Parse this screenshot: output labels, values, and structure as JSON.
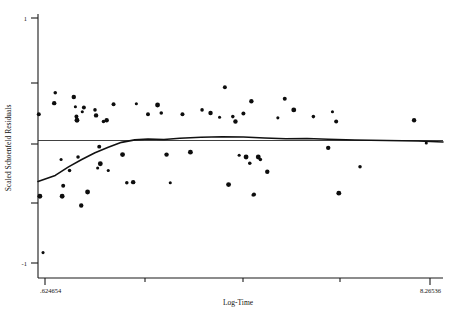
{
  "chart_data": {
    "type": "scatter",
    "title": "",
    "xlabel": "Log-Time",
    "ylabel": "Scaled Schoenfeld Residuals",
    "xlim": [
      0.624654,
      8.26536
    ],
    "ylim": [
      -1,
      1
    ],
    "grid": false,
    "legend": null,
    "x_tick_labels": [
      ".624654",
      "8.26536"
    ],
    "y_tick_labels": [
      "1",
      "-1"
    ],
    "y_tick_values": [
      1,
      0.5,
      0,
      -0.5,
      -1
    ],
    "reference_line": {
      "type": "horizontal",
      "y": 0
    },
    "points": [
      {
        "x": 0.72,
        "y": -0.915
      },
      {
        "x": 0.64,
        "y": 0.215
      },
      {
        "x": 0.66,
        "y": -0.455
      },
      {
        "x": 0.95,
        "y": 0.39
      },
      {
        "x": 0.93,
        "y": 0.305
      },
      {
        "x": 1.06,
        "y": -0.155
      },
      {
        "x": 1.1,
        "y": -0.37
      },
      {
        "x": 1.08,
        "y": -0.455
      },
      {
        "x": 1.22,
        "y": -0.245
      },
      {
        "x": 1.3,
        "y": 0.355
      },
      {
        "x": 1.33,
        "y": 0.275
      },
      {
        "x": 1.35,
        "y": 0.195
      },
      {
        "x": 1.36,
        "y": 0.165
      },
      {
        "x": 1.38,
        "y": -0.135
      },
      {
        "x": 1.44,
        "y": -0.53
      },
      {
        "x": 1.46,
        "y": 0.235
      },
      {
        "x": 1.49,
        "y": 0.27
      },
      {
        "x": 1.56,
        "y": -0.42
      },
      {
        "x": 1.7,
        "y": 0.25
      },
      {
        "x": 1.72,
        "y": 0.205
      },
      {
        "x": 1.75,
        "y": -0.225
      },
      {
        "x": 1.78,
        "y": -0.05
      },
      {
        "x": 1.8,
        "y": -0.19
      },
      {
        "x": 1.86,
        "y": 0.155
      },
      {
        "x": 1.92,
        "y": 0.165
      },
      {
        "x": 1.95,
        "y": -0.245
      },
      {
        "x": 2.05,
        "y": 0.295
      },
      {
        "x": 2.22,
        "y": -0.115
      },
      {
        "x": 2.3,
        "y": -0.345
      },
      {
        "x": 2.42,
        "y": -0.34
      },
      {
        "x": 2.48,
        "y": 0.3
      },
      {
        "x": 2.7,
        "y": 0.215
      },
      {
        "x": 2.88,
        "y": 0.29
      },
      {
        "x": 2.95,
        "y": 0.225
      },
      {
        "x": 3.05,
        "y": -0.115
      },
      {
        "x": 3.12,
        "y": -0.345
      },
      {
        "x": 3.35,
        "y": 0.215
      },
      {
        "x": 3.5,
        "y": -0.095
      },
      {
        "x": 3.72,
        "y": 0.25
      },
      {
        "x": 3.88,
        "y": 0.225
      },
      {
        "x": 4.05,
        "y": 0.19
      },
      {
        "x": 4.15,
        "y": 0.435
      },
      {
        "x": 4.22,
        "y": -0.36
      },
      {
        "x": 4.3,
        "y": 0.195
      },
      {
        "x": 4.35,
        "y": 0.155
      },
      {
        "x": 4.42,
        "y": -0.12
      },
      {
        "x": 4.5,
        "y": 0.22
      },
      {
        "x": 4.55,
        "y": -0.135
      },
      {
        "x": 4.62,
        "y": -0.185
      },
      {
        "x": 4.65,
        "y": 0.32
      },
      {
        "x": 4.68,
        "y": -0.445
      },
      {
        "x": 4.7,
        "y": -0.44
      },
      {
        "x": 4.78,
        "y": -0.135
      },
      {
        "x": 4.82,
        "y": -0.155
      },
      {
        "x": 4.95,
        "y": -0.255
      },
      {
        "x": 5.15,
        "y": 0.185
      },
      {
        "x": 5.28,
        "y": 0.34
      },
      {
        "x": 5.45,
        "y": 0.25
      },
      {
        "x": 5.82,
        "y": 0.195
      },
      {
        "x": 6.1,
        "y": -0.06
      },
      {
        "x": 6.18,
        "y": 0.235
      },
      {
        "x": 6.25,
        "y": 0.155
      },
      {
        "x": 6.3,
        "y": -0.43
      },
      {
        "x": 6.7,
        "y": -0.215
      },
      {
        "x": 7.72,
        "y": 0.165
      },
      {
        "x": 7.95,
        "y": -0.02
      }
    ],
    "smooth_curve": [
      {
        "x": 0.624654,
        "y": -0.335
      },
      {
        "x": 0.95,
        "y": -0.285
      },
      {
        "x": 1.2,
        "y": -0.215
      },
      {
        "x": 1.45,
        "y": -0.155
      },
      {
        "x": 1.7,
        "y": -0.1
      },
      {
        "x": 1.95,
        "y": -0.055
      },
      {
        "x": 2.2,
        "y": -0.015
      },
      {
        "x": 2.45,
        "y": 0.005
      },
      {
        "x": 2.7,
        "y": 0.012
      },
      {
        "x": 3.0,
        "y": 0.008
      },
      {
        "x": 3.3,
        "y": 0.018
      },
      {
        "x": 3.7,
        "y": 0.026
      },
      {
        "x": 4.1,
        "y": 0.03
      },
      {
        "x": 4.5,
        "y": 0.028
      },
      {
        "x": 4.9,
        "y": 0.02
      },
      {
        "x": 5.3,
        "y": 0.014
      },
      {
        "x": 5.7,
        "y": 0.016
      },
      {
        "x": 6.1,
        "y": 0.01
      },
      {
        "x": 6.6,
        "y": 0.004
      },
      {
        "x": 7.2,
        "y": 0.0
      },
      {
        "x": 7.8,
        "y": -0.004
      },
      {
        "x": 8.26536,
        "y": -0.012
      }
    ]
  },
  "axes": {
    "y_title": "Scaled Schoenfeld Residuals",
    "x_title": "Log-Time",
    "y_top_label": "1",
    "y_bottom_label": "-1",
    "x_left_label": ".624654",
    "x_right_label": "8.26536"
  },
  "colors": {
    "ink": "#111111",
    "point": "#0d0d0d",
    "curve": "#111111",
    "background": "#ffffff"
  }
}
